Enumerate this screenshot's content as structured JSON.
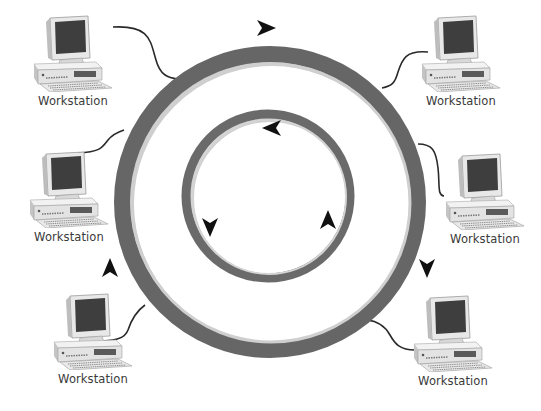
{
  "diagram": {
    "type": "token-ring-network",
    "colors": {
      "ring_dark": "#666666",
      "ring_highlight": "#d0d0d0",
      "arrow": "#111111",
      "cable": "#2a2a2a",
      "monitor_screen": "#3e3e3e",
      "case_body": "#e6e6e6",
      "label_text": "#3a3a3a"
    },
    "outer_ring": {
      "cx": 270,
      "cy": 202,
      "r": 148,
      "stroke_width": 16,
      "direction": "clockwise"
    },
    "inner_ring": {
      "cx": 268,
      "cy": 196,
      "r": 82,
      "stroke_width": 9,
      "direction": "counterclockwise"
    },
    "arrows": [
      {
        "id": "outer-top",
        "ring": "outer",
        "x": 266,
        "y": 28,
        "rotate": 0
      },
      {
        "id": "outer-right",
        "ring": "outer",
        "x": 427,
        "y": 268,
        "rotate": 90
      },
      {
        "id": "outer-left",
        "ring": "outer",
        "x": 110,
        "y": 268,
        "rotate": -90
      },
      {
        "id": "inner-top",
        "ring": "inner",
        "x": 272,
        "y": 128,
        "rotate": 180
      },
      {
        "id": "inner-left",
        "ring": "inner",
        "x": 210,
        "y": 227,
        "rotate": 90
      },
      {
        "id": "inner-right",
        "ring": "inner",
        "x": 328,
        "y": 220,
        "rotate": -90
      }
    ],
    "workstations": [
      {
        "id": "ws-top-left",
        "label": "Workstation",
        "x": 28,
        "y": 12
      },
      {
        "id": "ws-top-right",
        "label": "Workstation",
        "x": 416,
        "y": 12
      },
      {
        "id": "ws-mid-left",
        "label": "Workstation",
        "x": 24,
        "y": 148
      },
      {
        "id": "ws-mid-right",
        "label": "Workstation",
        "x": 440,
        "y": 150
      },
      {
        "id": "ws-bottom-left",
        "label": "Workstation",
        "x": 48,
        "y": 290
      },
      {
        "id": "ws-bottom-right",
        "label": "Workstation",
        "x": 408,
        "y": 292
      }
    ]
  }
}
